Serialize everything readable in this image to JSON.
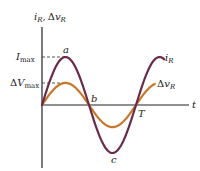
{
  "figure": {
    "y_axis_label": {
      "main": "i",
      "sub": "R",
      "sep": ",",
      "delta": "Δ",
      "v": "v",
      "vsub": "R"
    },
    "x_axis_label": "t",
    "tick_labels": {
      "imax": {
        "main": "I",
        "sub": "max"
      },
      "vmax": {
        "delta": "Δ",
        "main": "V",
        "sub": "max"
      }
    },
    "points": {
      "a": "a",
      "b": "b",
      "c": "c",
      "T": "T"
    },
    "curve_labels": {
      "current": {
        "main": "i",
        "sub": "R"
      },
      "voltage": {
        "delta": "Δ",
        "main": "v",
        "sub": "R"
      }
    },
    "colors": {
      "current": "#6b2a4a",
      "voltage": "#c8772a",
      "axis": "#222222",
      "dash": "#444444"
    }
  },
  "chart_data": {
    "type": "line",
    "title": "",
    "xlabel": "t",
    "ylabel": "i_R, Δv_R",
    "x_ticks": [
      "T"
    ],
    "y_ticks": [
      "I_max",
      "ΔV_max"
    ],
    "series": [
      {
        "name": "i_R",
        "form": "I_max·sin(2πt/T)",
        "amplitude": 1.0,
        "t_range": [
          0,
          1.3
        ]
      },
      {
        "name": "Δv_R",
        "form": "ΔV_max·sin(2πt/T)",
        "amplitude": 0.46,
        "t_range": [
          0,
          1.2
        ]
      }
    ],
    "annotations": [
      {
        "label": "a",
        "t": 0.25,
        "note": "i_R maximum"
      },
      {
        "label": "b",
        "t": 0.5,
        "note": "zero crossing"
      },
      {
        "label": "c",
        "t": 0.75,
        "note": "i_R minimum"
      },
      {
        "label": "T",
        "t": 1.0,
        "note": "period"
      }
    ]
  }
}
